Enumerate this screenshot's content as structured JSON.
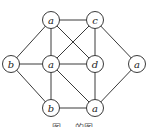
{
  "diagram": {
    "type": "graph",
    "nodes": [
      {
        "id": "n1",
        "label": "a",
        "x": 51,
        "y": 20
      },
      {
        "id": "n2",
        "label": "c",
        "x": 95,
        "y": 20
      },
      {
        "id": "n3",
        "label": "b",
        "x": 11,
        "y": 64
      },
      {
        "id": "n4",
        "label": "a",
        "x": 51,
        "y": 64
      },
      {
        "id": "n5",
        "label": "d",
        "x": 95,
        "y": 64
      },
      {
        "id": "n6",
        "label": "a",
        "x": 137,
        "y": 64
      },
      {
        "id": "n7",
        "label": "b",
        "x": 51,
        "y": 108
      },
      {
        "id": "n8",
        "label": "a",
        "x": 95,
        "y": 108
      }
    ],
    "edges": [
      [
        "n1",
        "n2"
      ],
      [
        "n1",
        "n3"
      ],
      [
        "n1",
        "n4"
      ],
      [
        "n1",
        "n5"
      ],
      [
        "n2",
        "n4"
      ],
      [
        "n2",
        "n5"
      ],
      [
        "n2",
        "n6"
      ],
      [
        "n3",
        "n4"
      ],
      [
        "n3",
        "n7"
      ],
      [
        "n4",
        "n5"
      ],
      [
        "n4",
        "n7"
      ],
      [
        "n4",
        "n8"
      ],
      [
        "n5",
        "n8"
      ],
      [
        "n6",
        "n8"
      ],
      [
        "n7",
        "n8"
      ]
    ],
    "caption": "图 ··· 的图"
  }
}
